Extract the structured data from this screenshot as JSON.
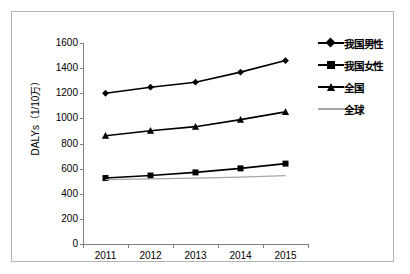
{
  "chart_data": {
    "type": "line",
    "title": "",
    "xlabel": "",
    "ylabel": "DALYs（1/10万）",
    "categories": [
      "2011",
      "2012",
      "2013",
      "2014",
      "2015"
    ],
    "ylim": [
      0,
      1600
    ],
    "yticks": [
      0,
      200,
      400,
      600,
      800,
      1000,
      1200,
      1400,
      1600
    ],
    "ytick_labels": [
      "0",
      "200",
      "400",
      "600",
      "800",
      "1000",
      "1200",
      "1400",
      "1600"
    ],
    "grid": false,
    "legend_position": "right",
    "series": [
      {
        "name": "我国男性",
        "marker": "diamond",
        "color": "#000000",
        "values": [
          1200,
          1248,
          1288,
          1368,
          1460
        ]
      },
      {
        "name": "我国女性",
        "marker": "square",
        "color": "#000000",
        "values": [
          525,
          545,
          570,
          602,
          640
        ]
      },
      {
        "name": "全国",
        "marker": "triangle",
        "color": "#000000",
        "values": [
          862,
          902,
          934,
          990,
          1052
        ]
      },
      {
        "name": "全球",
        "marker": "none",
        "color": "#a6a6a6",
        "values": [
          512,
          518,
          524,
          532,
          545
        ]
      }
    ]
  },
  "axis": {
    "y_title": "DALYs（1/10万）"
  },
  "legend": {
    "items": [
      {
        "label": "我国男性"
      },
      {
        "label": "我国女性"
      },
      {
        "label": "全国"
      },
      {
        "label": "全球"
      }
    ]
  }
}
